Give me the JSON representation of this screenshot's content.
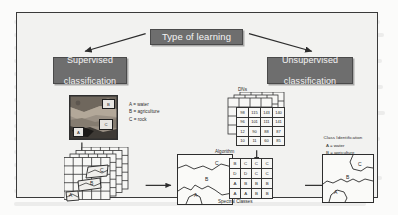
{
  "figure": {
    "title_box": "Type of learning",
    "left_branch": {
      "heading_line1": "Supervised",
      "heading_line2": "classification",
      "legend": [
        "A = water",
        "B = agriculture",
        "C = rock"
      ],
      "photo_samples": [
        {
          "label": "B"
        },
        {
          "label": "C"
        },
        {
          "label": "A"
        }
      ],
      "stack_samples": [
        {
          "label": "C"
        },
        {
          "label": "B"
        },
        {
          "label": "A"
        }
      ],
      "map_labels": [
        {
          "label": "C"
        },
        {
          "label": "B"
        },
        {
          "label": "A"
        }
      ]
    },
    "right_branch": {
      "heading_line1": "Unsupervised",
      "heading_line2": "classification",
      "dns_label": "DNs",
      "algorithm_label": "Algorithm",
      "spectral_classes_label": "Spectral Classes",
      "class_identification_title": "Class Identification",
      "class_identification_legend": [
        "A = water",
        "B = agriculture",
        "C = rock"
      ],
      "dn_grid": [
        [
          "98",
          "115",
          "143",
          "140"
        ],
        [
          "96",
          "101",
          "111",
          "141"
        ],
        [
          "12",
          "90",
          "88",
          "87"
        ],
        [
          "10",
          "11",
          "60",
          "85"
        ]
      ],
      "spectral_grid": [
        [
          "B",
          "C",
          "C",
          "C"
        ],
        [
          "D",
          "D",
          "C",
          "C"
        ],
        [
          "A",
          "B",
          "B",
          "B"
        ],
        [
          "A",
          "A",
          "B",
          "B"
        ]
      ],
      "map_labels": [
        {
          "label": "C"
        },
        {
          "label": "B"
        },
        {
          "label": "A"
        }
      ]
    },
    "colors": {
      "box_fill": "#6e6e6e",
      "box_text": "#f4f4f4",
      "frame_bg": "#f2f2f0",
      "line": "#2d2d2d"
    }
  }
}
